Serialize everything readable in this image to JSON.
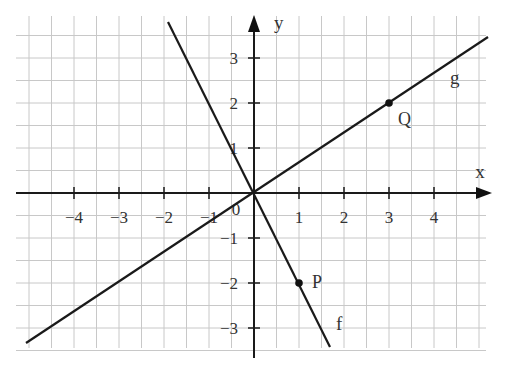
{
  "chart_data": {
    "type": "line",
    "title": "",
    "xlabel": "x",
    "ylabel": "y",
    "xlim": [
      -5.5,
      5
    ],
    "ylim": [
      -3.5,
      3.5
    ],
    "grid": true,
    "grid_step": 0.5,
    "x_ticks": [
      -4,
      -3,
      -2,
      -1,
      1,
      2,
      3,
      4
    ],
    "x_tick_labels": [
      "−4",
      "−3",
      "−2",
      "−1",
      "1",
      "2",
      "3",
      "4"
    ],
    "y_ticks": [
      -3,
      -2,
      -1,
      1,
      2,
      3
    ],
    "y_tick_labels": [
      "−3",
      "−2",
      "−1",
      "1",
      "2",
      "3"
    ],
    "origin_label": "0",
    "series": [
      {
        "name": "f",
        "equation": "y = -2x",
        "x": [
          -1.91,
          1.69
        ],
        "y": [
          3.8,
          -3.42
        ]
      },
      {
        "name": "g",
        "equation": "y = (2/3)x",
        "x": [
          -5.07,
          5.2
        ],
        "y": [
          -3.38,
          3.47
        ]
      }
    ],
    "points": [
      {
        "label": "P",
        "x": 1,
        "y": -2,
        "on": "f"
      },
      {
        "label": "Q",
        "x": 3,
        "y": 2,
        "on": "g"
      }
    ],
    "legend": null
  },
  "labels": {
    "x_axis": "x",
    "y_axis": "y",
    "origin": "0",
    "f": "f",
    "g": "g",
    "P": "P",
    "Q": "Q",
    "x_ticks": [
      "−4",
      "−3",
      "−2",
      "−1",
      "1",
      "2",
      "3",
      "4"
    ],
    "y_ticks": [
      "3",
      "2",
      "1",
      "−1",
      "−2",
      "−3"
    ]
  }
}
